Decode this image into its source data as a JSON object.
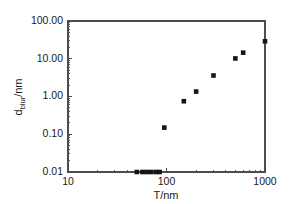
{
  "chart_data": {
    "type": "scatter",
    "title": "",
    "xlabel": "T/nm",
    "ylabel": "d_blur/nm",
    "ylabel_parts": {
      "base": "d",
      "subscript": "blur",
      "suffix": "/nm"
    },
    "xscale": "log",
    "yscale": "log",
    "xlim": [
      10,
      1000
    ],
    "ylim": [
      0.01,
      100
    ],
    "grid": false,
    "legend": false,
    "xticks": [
      10,
      100,
      1000
    ],
    "xtick_labels": [
      "10",
      "100",
      "1000"
    ],
    "yticks": [
      0.01,
      0.1,
      1,
      10,
      100
    ],
    "ytick_labels": [
      "0.01",
      "0.10",
      "1.00",
      "10.00",
      "100.00"
    ],
    "marker": "square",
    "marker_color": "#151515",
    "marker_size": 4.6,
    "points": [
      {
        "x": 50,
        "y": 0.01
      },
      {
        "x": 57,
        "y": 0.01
      },
      {
        "x": 63,
        "y": 0.01
      },
      {
        "x": 70,
        "y": 0.01
      },
      {
        "x": 78,
        "y": 0.01
      },
      {
        "x": 85,
        "y": 0.01
      },
      {
        "x": 95,
        "y": 0.15
      },
      {
        "x": 150,
        "y": 0.75
      },
      {
        "x": 200,
        "y": 1.35
      },
      {
        "x": 300,
        "y": 3.6
      },
      {
        "x": 500,
        "y": 10.2
      },
      {
        "x": 600,
        "y": 14.5
      },
      {
        "x": 1000,
        "y": 29.0
      }
    ],
    "axis_color": "#4d4d4d",
    "background": "#ffffff"
  },
  "geometry": {
    "plot_left": 68,
    "plot_right": 265,
    "plot_top": 21,
    "plot_bottom": 172
  }
}
